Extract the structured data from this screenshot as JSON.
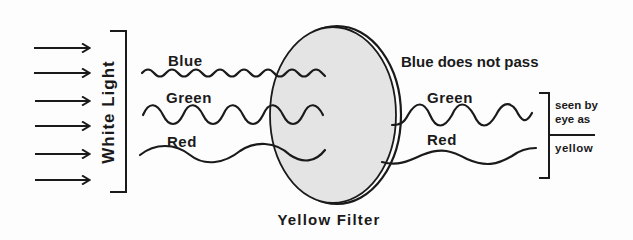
{
  "diagram": {
    "title": "Yellow Filter",
    "input_label": "White Light",
    "incoming_arrow_count": 6,
    "incoming_waves": [
      {
        "label": "Blue",
        "color_name": "blue"
      },
      {
        "label": "Green",
        "color_name": "green"
      },
      {
        "label": "Red",
        "color_name": "red"
      }
    ],
    "filter": {
      "label": "Yellow Filter",
      "fill": "#e4e4e4"
    },
    "blocked_note": "Blue does not pass",
    "outgoing_waves": [
      {
        "label": "Green"
      },
      {
        "label": "Red"
      }
    ],
    "perception": {
      "line1": "seen by",
      "line2": "eye as",
      "result": "yellow"
    }
  },
  "colors": {
    "ink": "#1a1a1a",
    "filter_fill": "#e4e4e4",
    "background": "#fdfdfd"
  }
}
